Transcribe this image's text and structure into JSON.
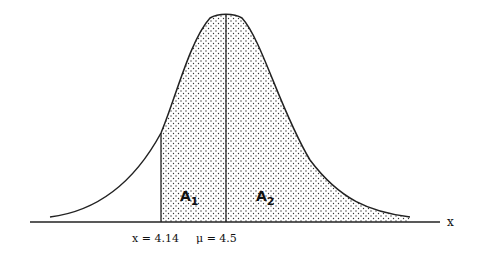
{
  "diagram": {
    "type": "normal-distribution-curve",
    "axis_label": "x",
    "mean_label": "μ = 4.5",
    "x_value_label": "x = 4.14",
    "region_left": {
      "letter": "A",
      "subscript": "1"
    },
    "region_right": {
      "letter": "A",
      "subscript": "2"
    },
    "shading": "stippled",
    "colors": {
      "line": "#222222",
      "background": "#ffffff"
    }
  }
}
